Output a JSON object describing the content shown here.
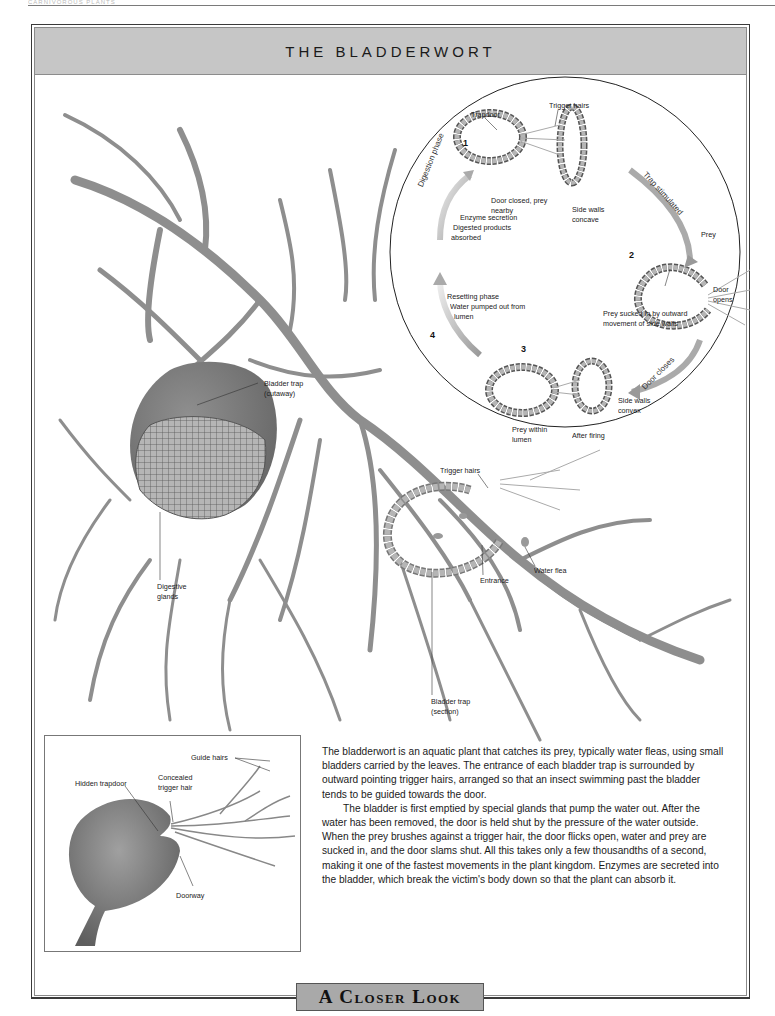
{
  "page": {
    "running_head": "CARNIVOROUS PLANTS",
    "title": "THE BLADDERWORT",
    "footer_tab": "A Closer Look"
  },
  "cycle_diagram": {
    "stages": [
      {
        "number": "1",
        "labels": [
          "Trapdoor",
          "Trigger hairs",
          "Door closed, prey nearby",
          "Side walls concave"
        ]
      },
      {
        "number": "2",
        "labels": [
          "Prey",
          "Door opens",
          "Prey sucked in by outward movement of side walls"
        ]
      },
      {
        "number": "3",
        "labels": [
          "Prey within lumen",
          "After firing",
          "Side walls convex"
        ]
      },
      {
        "number": "4",
        "labels": [
          "Resetting phase",
          "Water pumped out from lumen"
        ]
      }
    ],
    "arrows": {
      "trap_stimulated": "Trap stimulated",
      "door_closes": "Door closes",
      "digestion_phase": "Digestion phase"
    },
    "digestion_note": [
      "Enzyme secretion",
      "Digested products",
      "absorbed"
    ],
    "resetting_note": [
      "Resetting phase",
      "Water pumped out from",
      "lumen"
    ]
  },
  "labels": {
    "trapdoor": "Trapdoor",
    "trigger_hairs_top": "Trigger hairs",
    "door_closed_1": "Door closed, prey",
    "door_closed_2": "nearby",
    "side_walls_concave_1": "Side walls",
    "side_walls_concave_2": "concave",
    "prey": "Prey",
    "door_opens_1": "Door",
    "door_opens_2": "opens",
    "prey_sucked_1": "Prey sucked in by outward",
    "prey_sucked_2": "movement of side walls",
    "prey_within_1": "Prey within",
    "prey_within_2": "lumen",
    "after_firing": "After firing",
    "side_walls_convex_1": "Side walls",
    "side_walls_convex_2": "convex",
    "bladder_cutaway_1": "Bladder trap",
    "bladder_cutaway_2": "(cutaway)",
    "digestive_glands_1": "Digestive",
    "digestive_glands_2": "glands",
    "trigger_hairs_section": "Trigger hairs",
    "entrance": "Entrance",
    "water_flea": "Water flea",
    "bladder_section_1": "Bladder trap",
    "bladder_section_2": "(section)"
  },
  "inset": {
    "guide_hairs": "Guide hairs",
    "hidden_trapdoor": "Hidden trapdoor",
    "concealed_trigger_1": "Concealed",
    "concealed_trigger_2": "trigger hair",
    "doorway": "Doorway"
  },
  "body_text": {
    "paragraphs": [
      "The bladderwort is an aquatic plant that catches its prey, typically water fleas, using small bladders carried by the leaves. The entrance of each bladder trap is surrounded by outward pointing trigger hairs, arranged so that an insect swimming past the bladder tends to be guided towards the door.",
      "The bladder is first emptied by special glands that pump the water out. After the water has been removed, the door is held shut by the pressure of the water outside. When the prey brushes against a trigger hair, the door flicks open, water and prey are sucked in, and the door slams shut. All this takes only a few thousandths of a second, making it one of the fastest movements in the plant kingdom. Enzymes are secreted into the bladder, which break the victim's body down so that the plant can absorb it."
    ]
  },
  "colors": {
    "title_band": "#c6c6c6",
    "stem": "#8e8e8e",
    "bladder": "#7d7d7d",
    "footer_tab": "#a9a9a9"
  }
}
